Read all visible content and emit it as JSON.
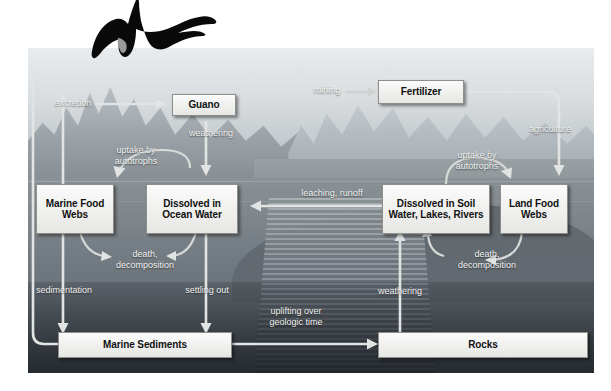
{
  "diagram": {
    "type": "biogeochemical-cycle-diagram",
    "background_scene": "coastal landscape with ocean, mountains, waterfall and rocky shoreline",
    "accent_arrow_color": "#e2e4e3",
    "box_fill_color": "#f2f2f0",
    "box_text_color": "#111111",
    "label_text_color": "#f2f3f2"
  },
  "boxes": [
    {
      "id": "guano",
      "label": "Guano"
    },
    {
      "id": "fertilizer",
      "label": "Fertilizer"
    },
    {
      "id": "marine-food-webs",
      "label": "Marine\nFood\nWebs"
    },
    {
      "id": "dissolved-ocean",
      "label": "Dissolved\nin Ocean\nWater"
    },
    {
      "id": "dissolved-soil",
      "label": "Dissolved\nin Soil Water,\nLakes, Rivers"
    },
    {
      "id": "land-food-webs",
      "label": "Land\nFood\nWebs"
    },
    {
      "id": "marine-sediments",
      "label": "Marine Sediments"
    },
    {
      "id": "rocks",
      "label": "Rocks"
    }
  ],
  "flows": [
    {
      "id": "excretion",
      "label": "excretion",
      "from": "marine-food-webs",
      "to": "guano"
    },
    {
      "id": "mining",
      "label": "mining",
      "from": "guano",
      "to": "fertilizer"
    },
    {
      "id": "weathering-guano",
      "label": "weathering",
      "from": "guano",
      "to": "dissolved-ocean"
    },
    {
      "id": "uptake-marine",
      "label": "uptake by\nautotrophs",
      "from": "dissolved-ocean",
      "to": "marine-food-webs"
    },
    {
      "id": "death-marine",
      "label": "death,\ndecomposition",
      "from": "marine-food-webs",
      "to": "dissolved-ocean"
    },
    {
      "id": "sedimentation",
      "label": "sedimentation",
      "from": "marine-food-webs",
      "to": "marine-sediments"
    },
    {
      "id": "settling-out",
      "label": "settling out",
      "from": "dissolved-ocean",
      "to": "marine-sediments"
    },
    {
      "id": "uplifting",
      "label": "uplifting over\ngeologic time",
      "from": "marine-sediments",
      "to": "rocks"
    },
    {
      "id": "weathering-rocks",
      "label": "weathering",
      "from": "rocks",
      "to": "dissolved-soil"
    },
    {
      "id": "leaching-runoff",
      "label": "leaching, runoff",
      "from": "dissolved-soil",
      "to": "dissolved-ocean"
    },
    {
      "id": "agriculture",
      "label": "agriculture",
      "from": "fertilizer",
      "to": "land-food-webs"
    },
    {
      "id": "uptake-land",
      "label": "uptake by\nautotrophs",
      "from": "dissolved-soil",
      "to": "land-food-webs"
    },
    {
      "id": "death-land",
      "label": "death,\ndecomposition",
      "from": "land-food-webs",
      "to": "dissolved-soil"
    }
  ],
  "illustration": {
    "bird": "frigatebird-silhouette"
  }
}
